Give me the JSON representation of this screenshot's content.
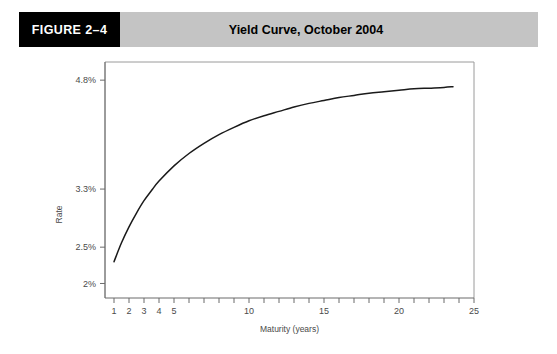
{
  "header": {
    "figure_number": "FIGURE 2–4",
    "title": "Yield Curve, October 2004",
    "band_color": "#c4c4c4",
    "number_box_color": "#000000",
    "number_text_color": "#ffffff"
  },
  "chart_data": {
    "type": "line",
    "title": "Yield Curve, October 2004",
    "xlabel": "Maturity (years)",
    "ylabel": "Rate",
    "xlim": [
      0.4,
      25
    ],
    "ylim": [
      1.8,
      5.05
    ],
    "grid": false,
    "legend": "none",
    "line_color": "#1a1a1a",
    "x_ticks": [
      1,
      2,
      3,
      4,
      5,
      6,
      7,
      8,
      9,
      10,
      11,
      12,
      13,
      14,
      15,
      16,
      17,
      18,
      19,
      20,
      21,
      22,
      23,
      24,
      25
    ],
    "x_tick_labels": [
      {
        "value": 1,
        "label": "1"
      },
      {
        "value": 2,
        "label": "2"
      },
      {
        "value": 3,
        "label": "3"
      },
      {
        "value": 4,
        "label": "4"
      },
      {
        "value": 5,
        "label": "5"
      },
      {
        "value": 10,
        "label": "10"
      },
      {
        "value": 15,
        "label": "15"
      },
      {
        "value": 20,
        "label": "20"
      },
      {
        "value": 25,
        "label": "25"
      }
    ],
    "y_ticks": [
      {
        "value": 4.8,
        "label": "4.8%"
      },
      {
        "value": 3.3,
        "label": "3.3%"
      },
      {
        "value": 2.5,
        "label": "2.5%"
      },
      {
        "value": 2.0,
        "label": "2%"
      }
    ],
    "series": [
      {
        "name": "Yield Curve October 2004",
        "x": [
          1.0,
          1.5,
          2.0,
          2.5,
          3.0,
          3.5,
          4.0,
          5.0,
          6.0,
          7.0,
          8.0,
          9.0,
          10.0,
          11.0,
          12.0,
          13.0,
          14.0,
          15.0,
          16.0,
          17.0,
          18.0,
          19.0,
          20.0,
          21.0,
          22.0,
          23.0,
          23.6
        ],
        "y": [
          2.3,
          2.56,
          2.78,
          2.97,
          3.14,
          3.28,
          3.41,
          3.62,
          3.79,
          3.93,
          4.05,
          4.15,
          4.24,
          4.31,
          4.37,
          4.43,
          4.48,
          4.52,
          4.56,
          4.59,
          4.62,
          4.64,
          4.66,
          4.68,
          4.69,
          4.7,
          4.71
        ]
      }
    ]
  }
}
